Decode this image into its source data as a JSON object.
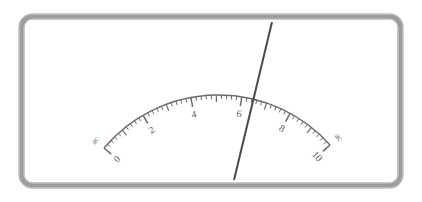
{
  "instrument": {
    "kind": "analog-panel-meter",
    "face_color": "#ffffff",
    "bezel_color": "#9a9a9a",
    "bezel_highlight": "#c9c9c9",
    "bezel_shadow": "#7e7e7e",
    "scale_color": "#6b6b6b",
    "needle_color": "#4a4a4a",
    "label_color": "#5a5a5a"
  },
  "chart_data": {
    "type": "gauge",
    "title": "",
    "xlabel": "",
    "ylabel": "",
    "scale_min": 0,
    "scale_max": 10,
    "major_step": 2,
    "minor_step": 0.2,
    "half_step": 1,
    "needle_value": 6.4,
    "unit_text": "ac",
    "tick_labels": [
      "0",
      "2",
      "4",
      "6",
      "8",
      "10"
    ],
    "tick_values": [
      0,
      2,
      4,
      6,
      8,
      10
    ],
    "end_units": [
      "ac",
      "ac"
    ],
    "arc": {
      "left_end": [
        104,
        148
      ],
      "right_end": [
        330,
        145
      ],
      "apex": [
        217,
        95
      ],
      "bulge": "upward"
    },
    "needle": {
      "top": [
        272,
        22
      ],
      "bottom": [
        234,
        180
      ],
      "width_px": 2
    },
    "grid": false,
    "legend": false
  },
  "labels": {
    "zero": "0",
    "two": "2",
    "four": "4",
    "six": "6",
    "eight": "8",
    "ten": "10",
    "ac_left": "ac",
    "ac_right": "ac"
  }
}
